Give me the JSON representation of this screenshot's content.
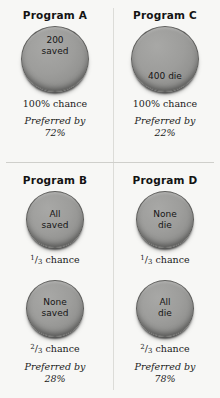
{
  "programs": {
    "a": {
      "title": "Program A",
      "outcomes": [
        {
          "coin_label_line1": "200",
          "coin_label_line2": "saved",
          "chance": "100% chance"
        }
      ],
      "preferred_label": "Preferred by",
      "preferred_value": "72%"
    },
    "c": {
      "title": "Program C",
      "outcomes": [
        {
          "coin_label_line1": "400 die",
          "coin_label_line2": "",
          "chance": "100% chance"
        }
      ],
      "preferred_label": "Preferred by",
      "preferred_value": "22%"
    },
    "b": {
      "title": "Program B",
      "outcomes": [
        {
          "coin_label_line1": "All",
          "coin_label_line2": "saved",
          "chance_num": "1",
          "chance_den": "3",
          "chance_suffix": " chance"
        },
        {
          "coin_label_line1": "None",
          "coin_label_line2": "saved",
          "chance_num": "2",
          "chance_den": "3",
          "chance_suffix": " chance"
        }
      ],
      "preferred_label": "Preferred by",
      "preferred_value": "28%"
    },
    "d": {
      "title": "Program D",
      "outcomes": [
        {
          "coin_label_line1": "None",
          "coin_label_line2": "die",
          "chance_num": "1",
          "chance_den": "3",
          "chance_suffix": " chance"
        },
        {
          "coin_label_line1": "All",
          "coin_label_line2": "die",
          "chance_num": "2",
          "chance_den": "3",
          "chance_suffix": " chance"
        }
      ],
      "preferred_label": "Preferred by",
      "preferred_value": "78%"
    }
  },
  "colors": {
    "background": "#f7f7f5",
    "coin_fill": "#9a9a9a",
    "coin_rim": "#5f5f5d",
    "divider": "#dcdcd8",
    "text": "#1b1b1b"
  }
}
